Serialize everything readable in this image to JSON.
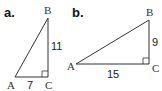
{
  "figure": {
    "triangle_a": {
      "part_label": "a.",
      "vertices": {
        "A": "A",
        "B": "B",
        "C": "C"
      },
      "side_AC": "7",
      "side_BC": "11",
      "right_angle_at": "C"
    },
    "triangle_b": {
      "part_label": "b.",
      "vertices": {
        "A": "A",
        "B": "B",
        "C": "C"
      },
      "side_AC": "15",
      "side_BC": "9",
      "right_angle_at": "C"
    },
    "colors": {
      "line": "#333333",
      "text": "#222222"
    }
  }
}
